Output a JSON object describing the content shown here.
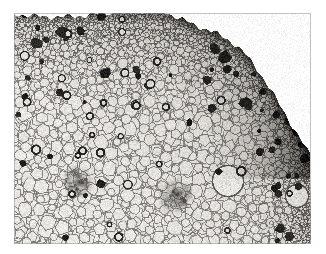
{
  "figure": {
    "kind": "light-micrograph",
    "background_color": "#ffffff"
  },
  "plate": {
    "x": 14,
    "y": 13,
    "width": 297,
    "height": 231,
    "border_color": "#9d9d9d",
    "paper_color": "#ffffff"
  },
  "image_tones": {
    "cell_lumen_light": "#eceae6",
    "cell_lumen_mid": "#dedbd6",
    "cell_wall": "#8d8a86",
    "cell_wall_dark": "#5d5b58",
    "dark_cell": "#1d1c1b",
    "sclerenchyma_band": "#4a4846",
    "vascular_bundle": "#7c7a76",
    "vignette": "#b4b1ad"
  },
  "regions": [
    {
      "name": "epidermis-edge",
      "note": "dark sclerenchymatous rind along upper and right margin"
    },
    {
      "name": "cortex",
      "note": "small densely packed cells beneath the rind"
    },
    {
      "name": "ground-parenchyma",
      "note": "large rounded pale cells filling the centre and lower left"
    },
    {
      "name": "vascular-bundle-left",
      "cx": 78,
      "cy": 182,
      "r": 16
    },
    {
      "name": "vascular-bundle-centre",
      "cx": 176,
      "cy": 196,
      "r": 18
    },
    {
      "name": "large-air-lacuna-right",
      "cx": 228,
      "cy": 181,
      "r": 15
    },
    {
      "name": "large-air-lacuna-corner",
      "cx": 297,
      "cy": 196,
      "r": 12
    }
  ],
  "render": {
    "seed": 20240917,
    "cell_count_small": 2600,
    "cell_count_large": 520,
    "dark_cell_count": 58,
    "grain_opacity": 0.16
  },
  "caption": {
    "text": ""
  }
}
